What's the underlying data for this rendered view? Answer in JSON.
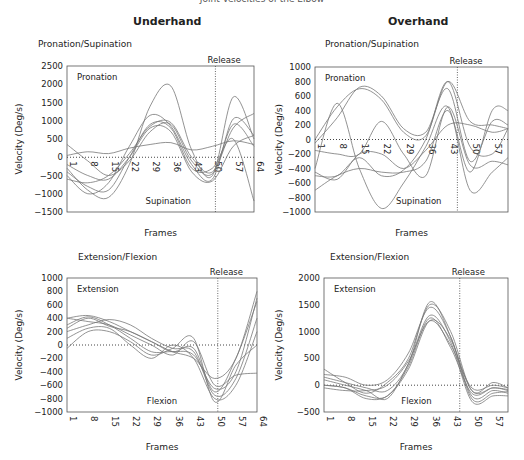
{
  "header": {
    "title": "Joint Velocities of the Elbow",
    "columns": [
      "Underhand",
      "Overhand"
    ]
  },
  "chart_data": [
    {
      "type": "line",
      "panel": "Underhand",
      "title": "Pronation/Supination",
      "xlabel": "Frames",
      "ylabel": "Velocity (Deg/s)",
      "ylim": [
        -1500,
        2500
      ],
      "yticks": [
        2500,
        2000,
        1500,
        1000,
        500,
        0,
        -500,
        -1000,
        -1500
      ],
      "xticks": [
        1,
        8,
        15,
        22,
        29,
        36,
        43,
        50,
        57,
        64
      ],
      "xlim": [
        1,
        64
      ],
      "release_frame": 51,
      "annotations": {
        "top": "Pronation",
        "bottom": "Supination",
        "release": "Release"
      },
      "x": [
        1,
        8,
        15,
        22,
        29,
        36,
        43,
        50,
        57,
        64
      ],
      "series": [
        {
          "name": "trial 1",
          "values": [
            -300,
            -900,
            -1100,
            -200,
            1400,
            1950,
            200,
            -500,
            1650,
            500
          ]
        },
        {
          "name": "trial 2",
          "values": [
            -500,
            -1000,
            -700,
            300,
            1150,
            850,
            -200,
            -600,
            1050,
            600
          ]
        },
        {
          "name": "trial 3",
          "values": [
            -600,
            -700,
            -500,
            100,
            850,
            950,
            0,
            -400,
            800,
            1200
          ]
        },
        {
          "name": "trial 4",
          "values": [
            -400,
            -800,
            -900,
            0,
            900,
            800,
            -300,
            -300,
            500,
            -1200
          ]
        },
        {
          "name": "trial 5",
          "values": [
            350,
            -100,
            -500,
            -100,
            700,
            900,
            -100,
            -450,
            900,
            300
          ]
        },
        {
          "name": "trial 6",
          "values": [
            50,
            150,
            100,
            250,
            350,
            400,
            200,
            300,
            450,
            350
          ]
        },
        {
          "name": "trial 7",
          "values": [
            -200,
            -500,
            -600,
            0,
            800,
            700,
            -400,
            -650,
            300,
            600
          ]
        }
      ]
    },
    {
      "type": "line",
      "panel": "Overhand",
      "title": "Pronation/Supination",
      "xlabel": "Frames",
      "ylabel": "Velocity (Deg/s)",
      "ylim": [
        -1000,
        1000
      ],
      "yticks": [
        1000,
        800,
        600,
        400,
        200,
        0,
        -200,
        -400,
        -600,
        -800,
        -1000
      ],
      "xticks": [
        1,
        8,
        15,
        22,
        29,
        36,
        43,
        50,
        57
      ],
      "xlim": [
        1,
        62
      ],
      "release_frame": 46,
      "annotations": {
        "top": "Pronation",
        "bottom": "Supination",
        "release": "Release"
      },
      "x": [
        1,
        8,
        15,
        22,
        29,
        36,
        43,
        50,
        57,
        62
      ],
      "series": [
        {
          "name": "trial 1",
          "values": [
            0,
            450,
            700,
            550,
            100,
            50,
            800,
            250,
            200,
            150
          ]
        },
        {
          "name": "trial 2",
          "values": [
            -50,
            300,
            720,
            600,
            150,
            100,
            700,
            -300,
            250,
            200
          ]
        },
        {
          "name": "trial 3",
          "values": [
            -400,
            500,
            -400,
            -950,
            -600,
            -100,
            450,
            -700,
            -450,
            -250
          ]
        },
        {
          "name": "trial 4",
          "values": [
            -700,
            -500,
            -400,
            -450,
            -450,
            -300,
            400,
            -450,
            400,
            400
          ]
        },
        {
          "name": "trial 5",
          "values": [
            -150,
            -200,
            -200,
            250,
            -200,
            -500,
            450,
            -350,
            -300,
            -350
          ]
        },
        {
          "name": "trial 6",
          "values": [
            -450,
            -550,
            -200,
            -200,
            -400,
            -150,
            200,
            200,
            100,
            150
          ]
        },
        {
          "name": "trial 7",
          "values": [
            -500,
            -500,
            -250,
            -500,
            -420,
            0,
            800,
            -100,
            -200,
            150
          ]
        }
      ]
    },
    {
      "type": "line",
      "panel": "Underhand",
      "title": "Extension/Flexion",
      "xlabel": "Frames",
      "ylabel": "Velocity (Deg/s)",
      "ylim": [
        -1000,
        1000
      ],
      "yticks": [
        1000,
        800,
        600,
        400,
        200,
        0,
        -200,
        -400,
        -600,
        -800,
        -1000
      ],
      "xticks": [
        1,
        8,
        15,
        22,
        29,
        36,
        43,
        50,
        57,
        64
      ],
      "xlim": [
        1,
        64
      ],
      "release_frame": 51,
      "annotations": {
        "top": "Extension",
        "bottom": "Flexion",
        "release": "Release"
      },
      "x": [
        1,
        8,
        15,
        22,
        29,
        36,
        43,
        50,
        57,
        64
      ],
      "series": [
        {
          "name": "trial 1",
          "values": [
            400,
            440,
            350,
            200,
            50,
            -100,
            -200,
            -500,
            -200,
            800
          ]
        },
        {
          "name": "trial 2",
          "values": [
            300,
            420,
            300,
            100,
            -100,
            -100,
            -150,
            -650,
            -400,
            700
          ]
        },
        {
          "name": "trial 3",
          "values": [
            200,
            300,
            380,
            300,
            100,
            -50,
            -100,
            -750,
            -500,
            400
          ]
        },
        {
          "name": "trial 4",
          "values": [
            100,
            250,
            250,
            0,
            -200,
            0,
            -200,
            -800,
            -600,
            200
          ]
        },
        {
          "name": "trial 5",
          "values": [
            -50,
            200,
            200,
            50,
            -150,
            -50,
            100,
            -850,
            -300,
            0
          ]
        },
        {
          "name": "trial 6",
          "values": [
            400,
            350,
            300,
            150,
            0,
            -150,
            50,
            -600,
            -450,
            -420
          ]
        },
        {
          "name": "trial 7",
          "values": [
            250,
            400,
            280,
            200,
            50,
            -100,
            -50,
            -700,
            -200,
            650
          ]
        }
      ]
    },
    {
      "type": "line",
      "panel": "Overhand",
      "title": "Extension/Flexion",
      "xlabel": "Frames",
      "ylabel": "Velocity (Deg/s)",
      "ylim": [
        -500,
        2000
      ],
      "yticks": [
        2000,
        1500,
        1000,
        500,
        0,
        -500
      ],
      "xticks": [
        1,
        8,
        15,
        22,
        29,
        36,
        43,
        50,
        57
      ],
      "xlim": [
        1,
        62
      ],
      "release_frame": 46,
      "annotations": {
        "top": "Extension",
        "bottom": "Flexion",
        "release": "Release"
      },
      "x": [
        1,
        8,
        15,
        22,
        29,
        36,
        43,
        50,
        57,
        62
      ],
      "series": [
        {
          "name": "trial 1",
          "values": [
            300,
            50,
            -150,
            50,
            500,
            1500,
            1000,
            -100,
            50,
            -50
          ]
        },
        {
          "name": "trial 2",
          "values": [
            200,
            150,
            0,
            100,
            600,
            1450,
            900,
            -200,
            -100,
            -150
          ]
        },
        {
          "name": "trial 3",
          "values": [
            100,
            0,
            -100,
            -250,
            400,
            1300,
            800,
            -300,
            -200,
            -200
          ]
        },
        {
          "name": "trial 4",
          "values": [
            0,
            -50,
            -200,
            -200,
            350,
            1250,
            700,
            -150,
            -50,
            -100
          ]
        },
        {
          "name": "trial 5",
          "values": [
            -50,
            -100,
            -100,
            0,
            450,
            1200,
            750,
            -50,
            0,
            -50
          ]
        },
        {
          "name": "trial 6",
          "values": [
            150,
            50,
            -50,
            -100,
            400,
            1550,
            900,
            -250,
            -150,
            -120
          ]
        },
        {
          "name": "trial 7",
          "values": [
            0,
            -50,
            -250,
            -200,
            300,
            1200,
            850,
            -100,
            -50,
            -80
          ]
        }
      ]
    }
  ]
}
